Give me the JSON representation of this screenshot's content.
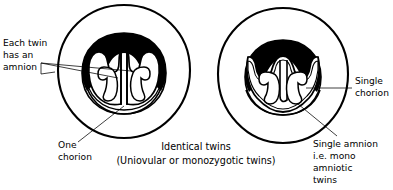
{
  "figure": {
    "caption": {
      "line1": "Identical twins",
      "line2": "(Uniovular or monozygotic twins)"
    },
    "colors": {
      "ink": "#000000",
      "background": "#ffffff",
      "placenta_fill": "#000000",
      "sac_fill": "#ffffff",
      "leader_line": "#000000"
    },
    "labels": {
      "each_twin_has_an_amnion": {
        "line1": "Each twin",
        "line2": "has an",
        "line3": "amnion"
      },
      "one_chorion": {
        "line1": "One",
        "line2": "chorion"
      },
      "single_chorion": {
        "line1": "Single",
        "line2": "chorion"
      },
      "single_amnion": {
        "line1": "Single amnion",
        "line2": "i.e. mono",
        "line3": "amniotic",
        "line4": "twins"
      }
    },
    "diagrams": [
      {
        "id": "diachorionic-monochorionic-diamniotic",
        "name": "Monochorionic diamniotic twins",
        "outer_structure": "chorion",
        "amnion_count": 2,
        "chorion_count": 1
      },
      {
        "id": "monochorionic-monoamniotic",
        "name": "Monochorionic monoamniotic twins",
        "outer_structure": "chorion",
        "amnion_count": 1,
        "chorion_count": 1
      }
    ]
  }
}
